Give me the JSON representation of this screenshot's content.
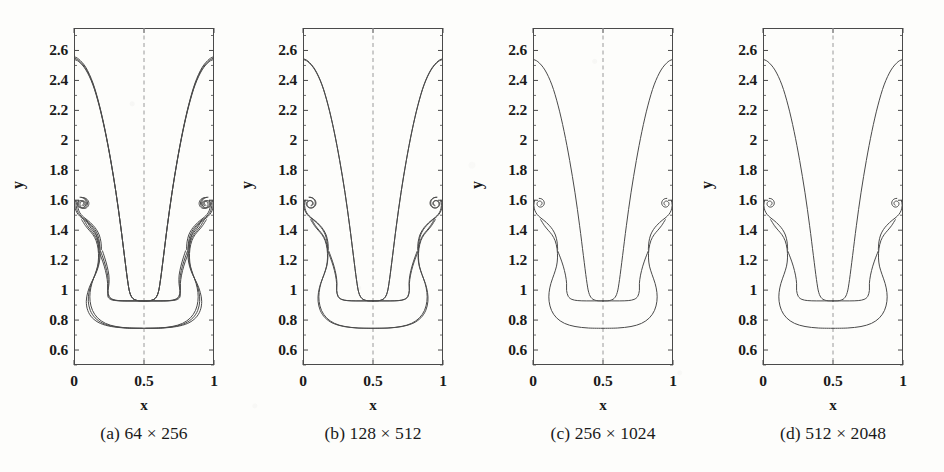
{
  "figure": {
    "kind": "grid-convergence-contour-panels",
    "panel_count": 4,
    "background_color": "#fdfdfb",
    "line_color": "#4a4a4a",
    "axis_color": "#4a4a4a",
    "symmetry_line_color": "#9a9a9a"
  },
  "axes": {
    "x_label": "x",
    "y_label": "y",
    "x_ticks": [
      "0",
      "0.5",
      "1"
    ],
    "x_tick_values": [
      0,
      0.5,
      1
    ],
    "y_ticks": [
      "0.6",
      "0.8",
      "1",
      "1.2",
      "1.4",
      "1.6",
      "1.8",
      "2",
      "2.2",
      "2.4",
      "2.6"
    ],
    "y_tick_values": [
      0.6,
      0.8,
      1.0,
      1.2,
      1.4,
      1.6,
      1.8,
      2.0,
      2.2,
      2.4,
      2.6
    ],
    "xlim": [
      0,
      1
    ],
    "ylim": [
      0.5,
      2.75
    ],
    "symmetry_line_x": 0.5
  },
  "panels": [
    {
      "id": "a",
      "caption": "(a) 64 × 256",
      "grid": "64 × 256",
      "nx": 64,
      "ny": 256,
      "contour_count": 3,
      "show_y_labels": true
    },
    {
      "id": "b",
      "caption": "(b) 128 × 512",
      "grid": "128 × 512",
      "nx": 128,
      "ny": 512,
      "contour_count": 2,
      "show_y_labels": true
    },
    {
      "id": "c",
      "caption": "(c) 256 × 1024",
      "grid": "256 × 1024",
      "nx": 256,
      "ny": 1024,
      "contour_count": 1,
      "show_y_labels": true
    },
    {
      "id": "d",
      "caption": "(d) 512 × 2048",
      "grid": "512 × 2048",
      "nx": 512,
      "ny": 2048,
      "contour_count": 1,
      "show_y_labels": true
    }
  ],
  "chart_data": {
    "type": "line",
    "title": "",
    "xlabel": "x",
    "ylabel": "y",
    "xlim": [
      0,
      1
    ],
    "ylim": [
      0.5,
      2.75
    ],
    "grid": false,
    "legend": "none",
    "annotations": [
      {
        "text": "bubble crest height",
        "y": 2.54
      },
      {
        "text": "spike tip depth",
        "y": 0.745
      },
      {
        "text": "roll-up vortex center",
        "y": 1.57
      }
    ],
    "series": [
      {
        "name": "(a) 64 × 256 interface",
        "panel": "a",
        "bubble_crest_y": 2.54,
        "spike_tip_y": 0.745,
        "vortex_center": [
          0.085,
          1.575
        ],
        "curves": 3
      },
      {
        "name": "(b) 128 × 512 interface",
        "panel": "b",
        "bubble_crest_y": 2.54,
        "spike_tip_y": 0.755,
        "vortex_center": [
          0.075,
          1.578
        ],
        "curves": 2
      },
      {
        "name": "(c) 256 × 1024 interface",
        "panel": "c",
        "bubble_crest_y": 2.545,
        "spike_tip_y": 0.748,
        "vortex_center": [
          0.068,
          1.582
        ],
        "curves": 1
      },
      {
        "name": "(d) 512 × 2048 interface",
        "panel": "d",
        "bubble_crest_y": 2.545,
        "spike_tip_y": 0.745,
        "vortex_center": [
          0.065,
          1.585
        ],
        "curves": 1
      }
    ]
  }
}
